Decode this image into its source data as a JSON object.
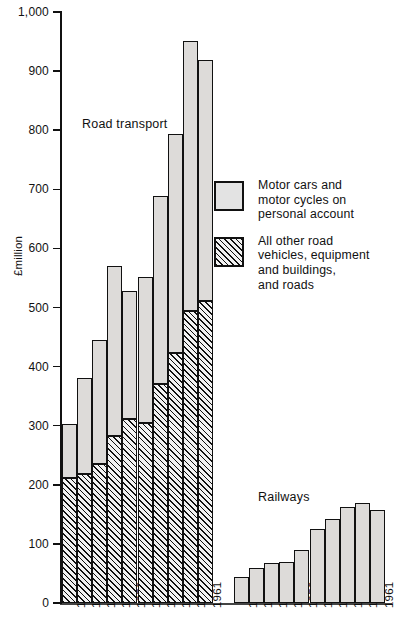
{
  "chart_data": {
    "type": "bar",
    "title": "",
    "xlabel": "",
    "ylabel": "£million",
    "ylim": [
      0,
      1000
    ],
    "ytick_labels": [
      "0",
      "100",
      "200",
      "300",
      "400",
      "500",
      "600",
      "700",
      "800",
      "900",
      "1,000"
    ],
    "ytick_values": [
      0,
      100,
      200,
      300,
      400,
      500,
      600,
      700,
      800,
      900,
      1000
    ],
    "grid": false,
    "legend_position": "right",
    "stacked": true,
    "categories": [
      "1952",
      "1953",
      "1954",
      "1955",
      "1956",
      "1957",
      "1958",
      "1959",
      "1960",
      "1961"
    ],
    "groups": [
      {
        "name": "Road transport",
        "series": [
          {
            "name": "All other road vehicles, equipment and buildings, and roads",
            "fill": "hatched",
            "values": [
              212,
              219,
              235,
              283,
              311,
              305,
              370,
              423,
              494,
              511
            ]
          },
          {
            "name": "Motor cars and motor cycles on personal account",
            "fill": "solid-grey",
            "values": [
              91,
              161,
              210,
              287,
              217,
              246,
              318,
              370,
              457,
              407
            ]
          }
        ],
        "totals": [
          303,
          380,
          445,
          570,
          528,
          551,
          688,
          793,
          951,
          918
        ]
      },
      {
        "name": "Railways",
        "series": [
          {
            "name": "Railways",
            "fill": "solid-grey",
            "values": [
              44,
              60,
              67,
              70,
              90,
              126,
              142,
              163,
              170,
              157
            ]
          }
        ],
        "totals": [
          44,
          60,
          67,
          70,
          90,
          126,
          142,
          163,
          170,
          157
        ]
      }
    ]
  },
  "legend": {
    "entries": [
      {
        "label": "Motor cars and\nmotor cycles on\npersonal account",
        "fill": "solid-grey"
      },
      {
        "label": "All other road\nvehicles, equipment\nand buildings,\nand roads",
        "fill": "hatched"
      }
    ]
  },
  "colors": {
    "bar_fill": "#e3e3e3",
    "bar_stroke": "#111111",
    "axis": "#111111",
    "background": "#ffffff"
  }
}
